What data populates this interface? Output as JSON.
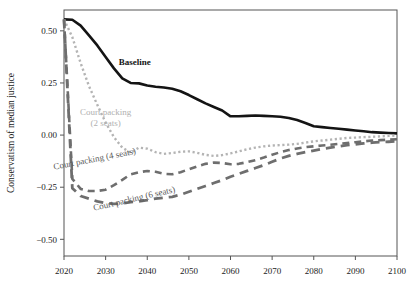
{
  "chart_data": {
    "type": "line",
    "title": "",
    "subtitle": "",
    "xlabel": "",
    "ylabel": "Conservatism of median justice",
    "xlim": [
      2020,
      2100
    ],
    "ylim": [
      -0.58,
      0.6
    ],
    "grid": false,
    "legend_position": "inline-annotations",
    "xticks": [
      2020,
      2030,
      2040,
      2050,
      2060,
      2070,
      2080,
      2090,
      2100
    ],
    "xtick_labels": [
      "2020",
      "2030",
      "2040",
      "2050",
      "2060",
      "2070",
      "2080",
      "2090",
      "2100"
    ],
    "yticks": [
      -0.5,
      -0.25,
      0.0,
      0.25,
      0.5
    ],
    "ytick_labels": [
      "-0.50",
      "-0.25",
      "0.00",
      "0.25",
      "0.50"
    ],
    "x": [
      2020,
      2022,
      2024,
      2026,
      2028,
      2030,
      2032,
      2034,
      2036,
      2038,
      2040,
      2042,
      2044,
      2046,
      2048,
      2050,
      2052,
      2054,
      2056,
      2058,
      2060,
      2062,
      2064,
      2066,
      2068,
      2070,
      2072,
      2074,
      2076,
      2078,
      2080,
      2082,
      2084,
      2086,
      2088,
      2090,
      2092,
      2094,
      2096,
      2098,
      2100
    ],
    "series": [
      {
        "name": "Baseline",
        "label": "Baseline",
        "style": "solid",
        "color": "#141414",
        "width": 2.6,
        "label_x": 2037,
        "label_y": 0.335,
        "label_rotation": 0,
        "values": [
          0.555,
          0.553,
          0.525,
          0.478,
          0.43,
          0.375,
          0.32,
          0.272,
          0.25,
          0.248,
          0.238,
          0.232,
          0.228,
          0.222,
          0.21,
          0.192,
          0.172,
          0.152,
          0.135,
          0.118,
          0.09,
          0.09,
          0.092,
          0.094,
          0.092,
          0.09,
          0.088,
          0.082,
          0.072,
          0.058,
          0.042,
          0.038,
          0.034,
          0.03,
          0.026,
          0.022,
          0.018,
          0.014,
          0.012,
          0.01,
          0.008
        ]
      },
      {
        "name": "Court packing (2 seats)",
        "label": "Court packing\n(2 seats)",
        "label_line1": "Court packing",
        "label_line2": "(2 seats)",
        "style": "dotted",
        "color": "#b4b4b4",
        "width": 2.4,
        "label_x": 2030,
        "label_y": 0.095,
        "label_rotation": 0,
        "values": [
          0.555,
          0.47,
          0.345,
          0.235,
          0.145,
          0.06,
          -0.01,
          -0.06,
          -0.085,
          -0.06,
          -0.065,
          -0.082,
          -0.09,
          -0.086,
          -0.08,
          -0.078,
          -0.085,
          -0.095,
          -0.1,
          -0.096,
          -0.088,
          -0.078,
          -0.068,
          -0.06,
          -0.054,
          -0.05,
          -0.048,
          -0.046,
          -0.042,
          -0.036,
          -0.03,
          -0.026,
          -0.022,
          -0.018,
          -0.014,
          -0.012,
          -0.01,
          -0.008,
          -0.006,
          -0.004,
          -0.002
        ]
      },
      {
        "name": "Court packing (4 seats)",
        "label": "Court packing (4 seats)",
        "style": "dashed",
        "color": "#6e6e6e",
        "width": 2.6,
        "label_x": 2027.5,
        "label_y": -0.128,
        "label_rotation": -11,
        "values": [
          0.555,
          -0.21,
          -0.258,
          -0.268,
          -0.268,
          -0.262,
          -0.24,
          -0.215,
          -0.188,
          -0.178,
          -0.172,
          -0.176,
          -0.186,
          -0.188,
          -0.178,
          -0.164,
          -0.15,
          -0.138,
          -0.132,
          -0.134,
          -0.14,
          -0.138,
          -0.13,
          -0.12,
          -0.108,
          -0.094,
          -0.082,
          -0.072,
          -0.064,
          -0.058,
          -0.054,
          -0.05,
          -0.046,
          -0.042,
          -0.038,
          -0.034,
          -0.03,
          -0.026,
          -0.024,
          -0.022,
          -0.02
        ]
      },
      {
        "name": "Court packing (6 seats)",
        "label": "Court packing (6 seats)",
        "style": "dashed-long",
        "color": "#6e6e6e",
        "width": 2.8,
        "label_x": 2037,
        "label_y": -0.318,
        "label_rotation": -13,
        "values": [
          0.555,
          -0.255,
          -0.292,
          -0.305,
          -0.318,
          -0.326,
          -0.33,
          -0.328,
          -0.322,
          -0.318,
          -0.312,
          -0.305,
          -0.3,
          -0.296,
          -0.286,
          -0.272,
          -0.258,
          -0.244,
          -0.23,
          -0.216,
          -0.2,
          -0.186,
          -0.172,
          -0.158,
          -0.144,
          -0.128,
          -0.112,
          -0.1,
          -0.09,
          -0.082,
          -0.074,
          -0.066,
          -0.06,
          -0.054,
          -0.048,
          -0.044,
          -0.04,
          -0.036,
          -0.034,
          -0.032,
          -0.03
        ]
      }
    ]
  },
  "axis": {
    "y_title": "Conservatism of median justice",
    "frame_color": "#555555",
    "tick_color": "#555555",
    "text_color": "#1b1b1b"
  }
}
